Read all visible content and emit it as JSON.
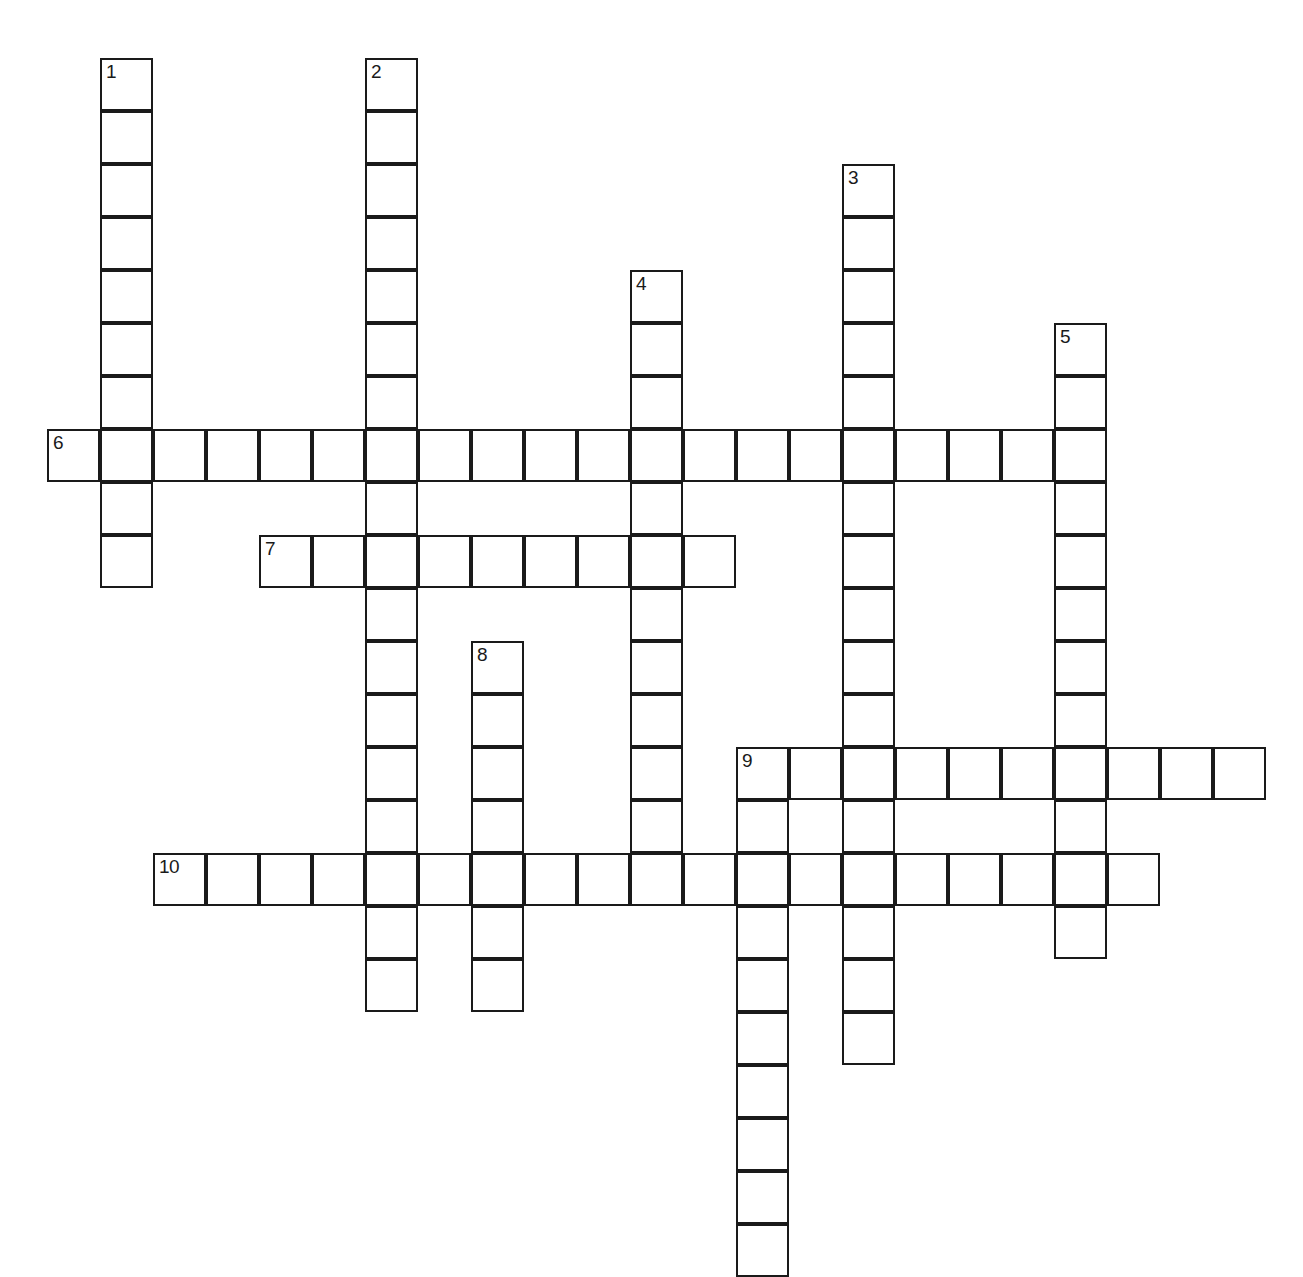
{
  "puzzle": {
    "type": "crossword-grid",
    "title": "",
    "background_color": "#ffffff",
    "line_color": "#1a1a1a",
    "cell_size_px": 53,
    "origin_x_px": 47,
    "origin_y_px": 58,
    "grid_columns": 24,
    "grid_rows": 23,
    "entries": [
      {
        "number": "1",
        "direction": "down",
        "col": 1,
        "row": 0,
        "length": 10
      },
      {
        "number": "2",
        "direction": "down",
        "col": 6,
        "row": 0,
        "length": 18
      },
      {
        "number": "3",
        "direction": "down",
        "col": 15,
        "row": 2,
        "length": 17
      },
      {
        "number": "4",
        "direction": "down",
        "col": 11,
        "row": 4,
        "length": 12
      },
      {
        "number": "5",
        "direction": "down",
        "col": 19,
        "row": 5,
        "length": 12
      },
      {
        "number": "6",
        "direction": "across",
        "col": 0,
        "row": 7,
        "length": 20
      },
      {
        "number": "7",
        "direction": "across",
        "col": 4,
        "row": 9,
        "length": 9
      },
      {
        "number": "8",
        "direction": "down",
        "col": 8,
        "row": 11,
        "length": 7
      },
      {
        "number": "9",
        "direction": "across",
        "col": 13,
        "row": 13,
        "length": 10
      },
      {
        "number": "9",
        "direction": "down",
        "col": 13,
        "row": 13,
        "length": 10
      },
      {
        "number": "10",
        "direction": "across",
        "col": 2,
        "row": 15,
        "length": 19
      }
    ],
    "numbered_labels": [
      "1",
      "2",
      "3",
      "4",
      "5",
      "6",
      "7",
      "8",
      "9",
      "10"
    ]
  }
}
